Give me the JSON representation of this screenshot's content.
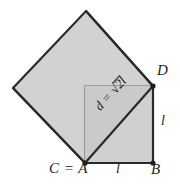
{
  "figure": {
    "canvas": {
      "width": 180,
      "height": 190
    },
    "colors": {
      "fill_rotated_square": "#d2d2d2",
      "fill_upright_square": "#d0d0d0",
      "fill_overlap_triangle": "#c9c9c9",
      "stroke_outer": "#2a2a2a",
      "stroke_inner": "#5a5a5a",
      "text": "#1d1d1d",
      "background": "#ffffff"
    },
    "shapes": {
      "rotated_square": {
        "name": "rotated-square",
        "points": "86,11 153,86 85,163 13,88"
      },
      "upright_square": {
        "name": "upright-square",
        "points": "85,86 153,86 153,163 85,163"
      },
      "diagonal": {
        "name": "diagonal-segment",
        "from": {
          "x": 85,
          "y": 163
        },
        "to": {
          "x": 153,
          "y": 86
        }
      }
    },
    "vertices": [
      {
        "name": "vertex-A",
        "x": 85,
        "y": 163
      },
      {
        "name": "vertex-B",
        "x": 153,
        "y": 163
      },
      {
        "name": "vertex-D",
        "x": 153,
        "y": 86
      }
    ],
    "labels": {
      "c_equals_a": "C = A",
      "side_bottom": "l",
      "vertex_b": "B",
      "vertex_d": "D",
      "side_right": "l",
      "diagonal_prefix": "d = ",
      "diagonal_radical": "√",
      "diagonal_radicand": "2l",
      "diagonal_full": "d = √2l"
    }
  }
}
